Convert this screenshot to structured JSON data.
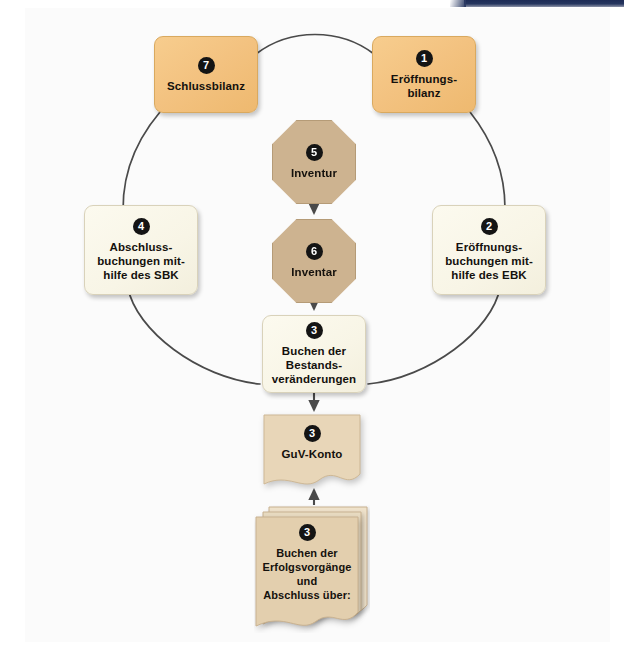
{
  "page": {
    "background_color": "#ffffff",
    "panel_color": "#fbfbfb",
    "accent_band_color": "#1d2b55"
  },
  "palette": {
    "orange_card": "#f3c280",
    "cream_card": "#f8f5e6",
    "octagon": "#cdb390",
    "paper": "#e3cfae",
    "badge": "#141414",
    "line": "#4a4a4a"
  },
  "nodes": [
    {
      "id": "n1",
      "number": "1",
      "shape": "rounded-card",
      "color": "orange",
      "lines": [
        "Eröffnungs-",
        "bilanz"
      ],
      "label": "Eröffnungsbilanz"
    },
    {
      "id": "n2",
      "number": "2",
      "shape": "rounded-card",
      "color": "cream",
      "lines": [
        "Eröffnungs-",
        "buchungen mit-",
        "hilfe des EBK"
      ],
      "label": "Eröffnungsbuchungen mithilfe des EBK"
    },
    {
      "id": "n3",
      "number": "3",
      "shape": "rounded-card",
      "color": "cream",
      "lines": [
        "Buchen der",
        "Bestands-",
        "veränderungen"
      ],
      "label": "Buchen der Bestandsveränderungen"
    },
    {
      "id": "n4",
      "number": "4",
      "shape": "rounded-card",
      "color": "cream",
      "lines": [
        "Abschluss-",
        "buchungen mit-",
        "hilfe des SBK"
      ],
      "label": "Abschlussbuchungen mithilfe des SBK"
    },
    {
      "id": "n5",
      "number": "5",
      "shape": "octagon",
      "color": "tan",
      "lines": [
        "Inventur"
      ],
      "label": "Inventur"
    },
    {
      "id": "n6",
      "number": "6",
      "shape": "octagon",
      "color": "tan",
      "lines": [
        "Inventar"
      ],
      "label": "Inventar"
    },
    {
      "id": "n7",
      "number": "7",
      "shape": "rounded-card",
      "color": "orange",
      "lines": [
        "Schlussbilanz"
      ],
      "label": "Schlussbilanz"
    },
    {
      "id": "guv",
      "number": "3",
      "shape": "torn-paper",
      "color": "paper",
      "lines": [
        "GuV-Konto"
      ],
      "label": "GuV-Konto"
    },
    {
      "id": "docstack",
      "number": "3",
      "shape": "paper-stack",
      "color": "paper",
      "lines": [
        "Buchen der",
        "Erfolgsvorgänge",
        "und",
        "Abschluss über:"
      ],
      "label": "Buchen der Erfolgsvorgänge und Abschluss über:"
    }
  ],
  "connections": [
    {
      "from": "n7",
      "to": "n1",
      "style": "curve",
      "arrow": false
    },
    {
      "from": "n1",
      "to": "n2",
      "style": "curve",
      "arrow": false
    },
    {
      "from": "n2",
      "to": "n3",
      "style": "curve",
      "arrow": false
    },
    {
      "from": "n3",
      "to": "n4",
      "style": "curve",
      "arrow": false
    },
    {
      "from": "n4",
      "to": "n7",
      "style": "curve",
      "arrow": false
    },
    {
      "from": "n5",
      "to": "n6",
      "style": "straight",
      "arrow": true
    },
    {
      "from": "n6",
      "to": "n3",
      "style": "straight",
      "arrow": true
    },
    {
      "from": "n3",
      "to": "guv",
      "style": "straight",
      "arrow": true
    },
    {
      "from": "docstack",
      "to": "guv",
      "style": "straight",
      "arrow": true
    }
  ]
}
